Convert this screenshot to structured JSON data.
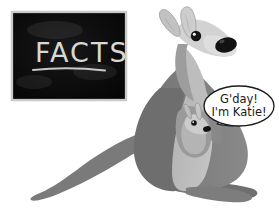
{
  "scene": {
    "title": "Kangaroo facts illustration",
    "background_color": "#ffffff",
    "width": 279,
    "height": 214
  },
  "blackboard": {
    "name": "blackboard",
    "board_color": "#0a0a0a",
    "frame_color": "#cfcfcf",
    "heading": "FACTS",
    "chalk_color": "#d8d8d4",
    "x": 12,
    "y": 12,
    "width": 114,
    "height": 88
  },
  "kangaroo": {
    "name": "mother-kangaroo",
    "body_color": "#7e7e7e",
    "belly_color": "#b9b9b9",
    "face_color": "#d4d4d4",
    "nose_color": "#141414",
    "eye_color": "#141414",
    "ear_inner_color": "#c9c9c9",
    "outline_color": "#6b6b6b"
  },
  "joey": {
    "name": "joey-in-pouch",
    "body_color": "#a8a8a8",
    "face_color": "#cfcfcf",
    "nose_color": "#141414",
    "eye_color": "#141414"
  },
  "speech_bubble": {
    "name": "speech-bubble",
    "fill_color": "#ffffff",
    "stroke_color": "#1a1a1a",
    "line1": "G'day!",
    "line2": "I'm Katie!"
  }
}
